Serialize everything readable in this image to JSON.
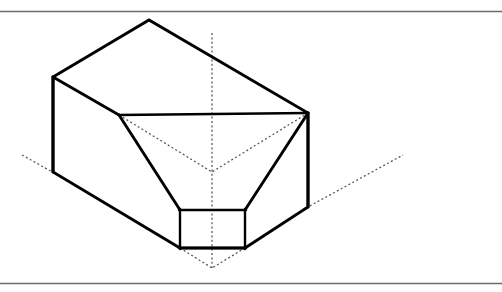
{
  "figure": {
    "kind": "isometric-technical-drawing",
    "title": "",
    "caption": "",
    "canvas": {
      "width": 502,
      "height": 292,
      "background": "#ffffff"
    },
    "colors": {
      "visible_edge": "#000000",
      "hidden_edge": "#555555",
      "center_line": "#555555",
      "frame_rule": "#6b6b6b",
      "face": "#ffffff"
    },
    "frame": {
      "top_rule_y": 11,
      "bottom_rule_y": 283,
      "x_start": 0,
      "x_end": 502
    },
    "line_styles": {
      "visible": "solid",
      "hidden": "dashed",
      "center": "dash-dot-fine"
    },
    "geometry": {
      "top_face": "149,20 308,113 119,115 53,77",
      "left_face": "53,77 119,115 180,210 180,248 53,172",
      "right_face": "308,113 308,207 245,248 245,210",
      "bottom_front_left": "53,172 180,248",
      "bottom_front_right": "245,248 308,207",
      "rim_horizontal": "119,115 308,113",
      "funnel_wall_left": "119,115 180,210",
      "funnel_wall_right": "308,113 245,210",
      "throat_rect": "180,210 245,210 245,248 180,248",
      "hidden_v_left": "119,115 212,172",
      "hidden_v_right": "308,113 212,172",
      "hidden_v_lower_left": "180,248 212,268",
      "hidden_v_lower_right": "245,248 212,268",
      "center_vertical": "212,33 212,268",
      "axis_left_ray": "22,155 53,172",
      "axis_right_ray": "308,207 403,155"
    }
  }
}
